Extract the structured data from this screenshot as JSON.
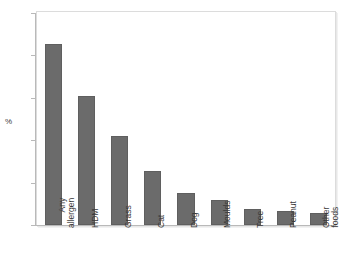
{
  "chart_data": {
    "type": "bar",
    "title": "",
    "subtitle": "",
    "xlabel": "",
    "ylabel": "%",
    "ylim": [
      0,
      25
    ],
    "yticks": [
      0,
      5,
      10,
      15,
      20,
      25
    ],
    "ytick_labels": [
      "0",
      "5",
      "10",
      "15",
      "20",
      "25"
    ],
    "grid": false,
    "legend": null,
    "bar_color": "#6b6b6b",
    "categories": [
      "Any allergen",
      "HDM",
      "Grass",
      "Cat",
      "Dog",
      "Moulds",
      "Tree",
      "Peanut",
      "Other foods"
    ],
    "category_lines": [
      [
        "Any",
        "allergen"
      ],
      [
        "HDM",
        ""
      ],
      [
        "Grass",
        ""
      ],
      [
        "Cat",
        ""
      ],
      [
        "Dog",
        ""
      ],
      [
        "Moulds",
        ""
      ],
      [
        "Tree",
        ""
      ],
      [
        "Peanut",
        ""
      ],
      [
        "Other",
        "foods"
      ]
    ],
    "values": [
      21.3,
      15.2,
      10.5,
      6.4,
      3.8,
      3.0,
      1.9,
      1.6,
      1.4
    ]
  }
}
